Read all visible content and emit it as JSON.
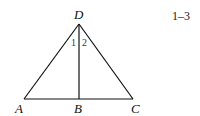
{
  "figure": {
    "number": "1–3",
    "points": {
      "A": "A",
      "B": "B",
      "C": "C",
      "D": "D"
    },
    "angles": {
      "one": "1",
      "two": "2"
    }
  }
}
